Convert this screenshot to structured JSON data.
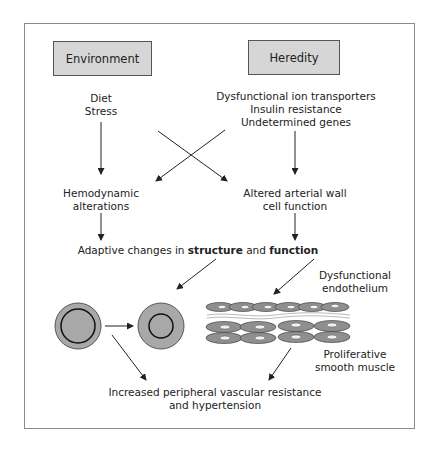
{
  "diagram": {
    "boxes": {
      "environment": "Environment",
      "heredity": "Heredity"
    },
    "environment_factors": [
      "Diet",
      "Stress"
    ],
    "heredity_factors": [
      "Dysfunctional ion transporters",
      "Insulin resistance",
      "Undetermined genes"
    ],
    "hemodynamic": [
      "Hemodynamic",
      "alterations"
    ],
    "arterial": [
      "Altered arterial wall",
      "cell function"
    ],
    "adaptive": {
      "prefix": "Adaptive changes in ",
      "bold1": "structure",
      "mid": " and ",
      "bold2": "function"
    },
    "endothelium_label": [
      "Dysfunctional",
      "endothelium"
    ],
    "smooth_muscle_label": [
      "Proliferative",
      "smooth muscle"
    ],
    "outcome": [
      "Increased peripheral vascular resistance",
      "and hypertension"
    ]
  },
  "colors": {
    "box_fill": "#d6d6d6",
    "vessel_fill": "#a8a8a8",
    "cell_fill": "#8f8f8f",
    "line": "#222222",
    "frame": "#8a8a8a"
  }
}
